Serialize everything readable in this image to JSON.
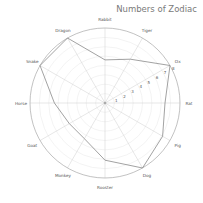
{
  "chart_data": {
    "type": "radar",
    "title": "Numbers of Zodiac",
    "categories": [
      "Rat",
      "Ox",
      "Tiger",
      "Rabbit",
      "Dragon",
      "Snake",
      "Horse",
      "Goat",
      "Monkey",
      "Rooster",
      "Dog",
      "Pig"
    ],
    "series": [
      {
        "name": "Numbers",
        "values": [
          6.4,
          8,
          5.4,
          4.6,
          8,
          8,
          5.4,
          4.4,
          4.4,
          6.1,
          8,
          7.1
        ]
      }
    ],
    "radial_ticks": [
      "1",
      "2",
      "3",
      "4",
      "5",
      "6",
      "7",
      "8"
    ],
    "rlim": [
      0,
      8
    ],
    "grid": true,
    "legend": "none",
    "colors": {
      "line": "#8a8a8a",
      "grid": "#e6e6e6",
      "axis": "#cfcfcf",
      "outer": "#999999",
      "text": "#555555",
      "title": "#7a7a7a"
    }
  }
}
